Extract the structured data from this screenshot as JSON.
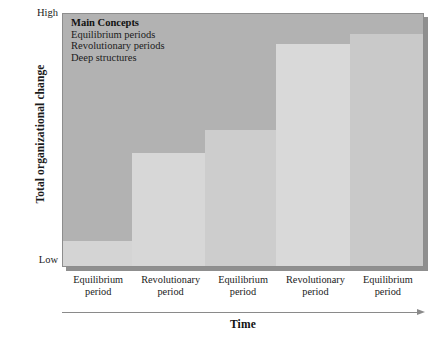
{
  "chart_data": {
    "type": "bar",
    "title": "",
    "xlabel": "Time",
    "ylabel": "Total organizational change",
    "ytick_labels": [
      "High",
      "Low"
    ],
    "ylim_labels": {
      "min": "Low",
      "max": "High"
    },
    "grid": false,
    "plot_background_color": "#b2b2b2",
    "categories": [
      "Equilibrium period",
      "Revolutionary period",
      "Equilibrium period",
      "Revolutionary period",
      "Equilibrium period"
    ],
    "category_lines": [
      {
        "line1": "Equilibrium",
        "line2": "period"
      },
      {
        "line1": "Revolutionary",
        "line2": "period"
      },
      {
        "line1": "Equilibrium",
        "line2": "period"
      },
      {
        "line1": "Revolutionary",
        "line2": "period"
      },
      {
        "line1": "Equilibrium",
        "line2": "period"
      }
    ],
    "values": [
      10,
      45,
      54,
      88,
      92
    ],
    "bars": [
      {
        "label": "Equilibrium period",
        "value": 10,
        "color": "#d4d4d4",
        "left_pct": 0,
        "width_pct": 19.06
      },
      {
        "label": "Revolutionary period",
        "value": 45,
        "color": "#d7d7d7",
        "left_pct": 19.06,
        "width_pct": 20.44
      },
      {
        "label": "Equilibrium period",
        "value": 54,
        "color": "#cdcdcd",
        "left_pct": 39.5,
        "width_pct": 19.61
      },
      {
        "label": "Revolutionary period",
        "value": 88,
        "color": "#d9d9d9",
        "left_pct": 59.11,
        "width_pct": 20.72
      },
      {
        "label": "Equilibrium period",
        "value": 92,
        "color": "#c9c9c9",
        "left_pct": 79.83,
        "width_pct": 20.17
      }
    ],
    "legend": {
      "position": "top-left-inside",
      "title": "Main Concepts",
      "entries": [
        "Equilibrium periods",
        "Revolutionary periods",
        "Deep structures"
      ]
    }
  },
  "axes": {
    "y_title": "Total organizational change",
    "y_high": "High",
    "y_low": "Low",
    "x_title": "Time"
  }
}
